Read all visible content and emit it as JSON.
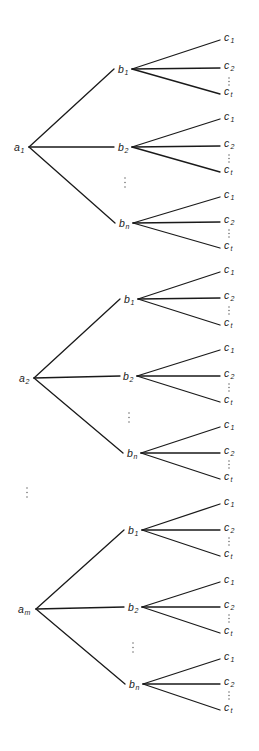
{
  "diagram": {
    "title": "",
    "line_color": "#1a1a1a",
    "leaf_labels": [
      {
        "base": "c",
        "sub": "1"
      },
      {
        "base": "c",
        "sub": "2"
      },
      {
        "base": "c",
        "sub": "t"
      }
    ],
    "trees": [
      {
        "root": {
          "base": "a",
          "sub": "1",
          "x": 29,
          "y": 147,
          "label_x": 14
        },
        "mid_ellipsis": {
          "x": 125,
          "y": 178
        },
        "branches": [
          {
            "base": "b",
            "sub": "1",
            "x": 132,
            "y": 69,
            "label_x": 118,
            "edge_end_x": 114,
            "leaves_y": [
              40,
              68,
              94
            ],
            "dots_y": 78
          },
          {
            "base": "b",
            "sub": "2",
            "x": 132,
            "y": 147,
            "label_x": 118,
            "edge_end_x": 114,
            "leaves_y": [
              119,
              146,
              172
            ],
            "dots_y": 155
          },
          {
            "base": "b",
            "sub": "n",
            "x": 133,
            "y": 223,
            "label_x": 119,
            "edge_end_x": 115,
            "leaves_y": [
              197,
              222,
              248
            ],
            "dots_y": 230
          }
        ]
      },
      {
        "root": {
          "base": "a",
          "sub": "2",
          "x": 34,
          "y": 378,
          "label_x": 19
        },
        "mid_ellipsis": {
          "x": 129,
          "y": 413
        },
        "branches": [
          {
            "base": "b",
            "sub": "1",
            "x": 138,
            "y": 299,
            "label_x": 124,
            "edge_end_x": 120,
            "leaves_y": [
              272,
              298,
              325
            ],
            "dots_y": 307
          },
          {
            "base": "b",
            "sub": "2",
            "x": 137,
            "y": 376,
            "label_x": 123,
            "edge_end_x": 120,
            "leaves_y": [
              350,
              376,
              402
            ],
            "dots_y": 384
          },
          {
            "base": "b",
            "sub": "n",
            "x": 141,
            "y": 453,
            "label_x": 127,
            "edge_end_x": 123,
            "leaves_y": [
              427,
              453,
              479
            ],
            "dots_y": 461
          }
        ]
      },
      {
        "root": {
          "base": "a",
          "sub": "m",
          "x": 36,
          "y": 609,
          "label_x": 18
        },
        "mid_ellipsis": {
          "x": 133,
          "y": 643
        },
        "branches": [
          {
            "base": "b",
            "sub": "1",
            "x": 142,
            "y": 530,
            "label_x": 128,
            "edge_end_x": 124,
            "leaves_y": [
              504,
              530,
              556
            ],
            "dots_y": 538
          },
          {
            "base": "b",
            "sub": "2",
            "x": 142,
            "y": 607,
            "label_x": 128,
            "edge_end_x": 124,
            "leaves_y": [
              582,
              607,
              633
            ],
            "dots_y": 615
          },
          {
            "base": "b",
            "sub": "n",
            "x": 143,
            "y": 684,
            "label_x": 129,
            "edge_end_x": 125,
            "leaves_y": [
              659,
              684,
              710
            ],
            "dots_y": 692
          }
        ]
      }
    ],
    "leaf_line_end_x": 220,
    "leaf_label_x": 224,
    "root_ellipsis": {
      "x": 27,
      "y": 488
    }
  }
}
